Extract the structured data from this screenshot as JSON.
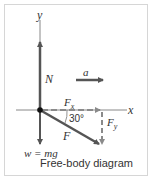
{
  "diagram": {
    "caption": "Free-body diagram",
    "axes": {
      "x_label": "x",
      "y_label": "y"
    },
    "forces": {
      "normal": {
        "label": "N"
      },
      "weight": {
        "label": "w = mg"
      },
      "applied": {
        "label": "F",
        "angle_label": "30°"
      },
      "applied_x": {
        "label_main": "F",
        "label_sub": "x"
      },
      "applied_y": {
        "label_main": "F",
        "label_sub": "y"
      }
    },
    "acceleration": {
      "label": "a"
    },
    "colors": {
      "force_arrow": "#555555",
      "component_dashed": "#8a8a8a",
      "axis": "#777777",
      "frame": "#d6d6d6",
      "text": "#333333"
    }
  }
}
